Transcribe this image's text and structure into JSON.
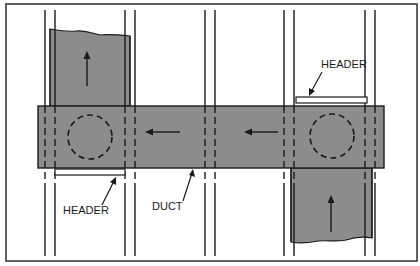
{
  "diagram": {
    "colors": {
      "background": "#ffffff",
      "frame": "#3a3a3a",
      "duct_fill": "#8c8c8c",
      "line": "#1a1a1a",
      "header_fill": "#ffffff"
    },
    "labels": {
      "header_top": "HEADER",
      "header_bottom": "HEADER",
      "duct": "DUCT"
    },
    "studs_x": [
      45,
      55,
      125,
      135,
      205,
      215,
      284,
      294,
      365,
      375
    ],
    "main_duct": {
      "x": 38,
      "y": 106,
      "width": 346,
      "height": 62
    },
    "riser_top": {
      "x": 50,
      "top": 29,
      "bottom": 106,
      "width": 80,
      "flow": "up"
    },
    "riser_bottom": {
      "x": 291,
      "top": 168,
      "bottom": 243,
      "width": 81,
      "flow": "up"
    },
    "flow_arrows": [
      {
        "location": "main-duct-left",
        "direction": "left"
      },
      {
        "location": "main-duct-right",
        "direction": "left"
      },
      {
        "location": "riser-top",
        "direction": "up"
      },
      {
        "location": "riser-bottom",
        "direction": "up"
      }
    ],
    "openings": [
      {
        "shape": "dashed-circle",
        "cx": 90,
        "cy": 137,
        "r": 22
      },
      {
        "shape": "dashed-circle",
        "cx": 332,
        "cy": 136,
        "r": 22
      }
    ]
  }
}
